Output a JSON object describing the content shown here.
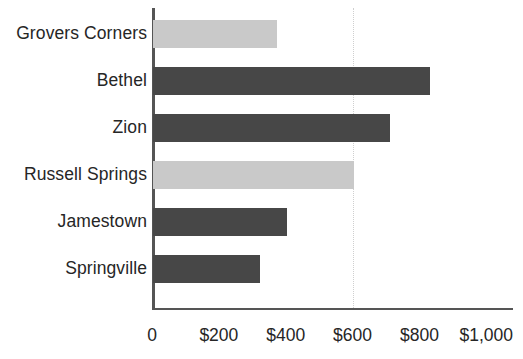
{
  "chart_data": {
    "type": "bar",
    "orientation": "horizontal",
    "title": "",
    "subtitle": "",
    "xlabel": "",
    "ylabel": "",
    "categories": [
      "Grovers Corners",
      "Bethel",
      "Zion",
      "Russell Springs",
      "Jamestown",
      "Springville"
    ],
    "values": [
      370,
      830,
      710,
      600,
      400,
      320
    ],
    "bar_colors": [
      "#c9c9c9",
      "#474747",
      "#474747",
      "#c9c9c9",
      "#474747",
      "#474747"
    ],
    "xlim": [
      0,
      1080
    ],
    "ylim": [
      0,
      6
    ],
    "x_ticks": [
      0,
      200,
      400,
      600,
      800,
      1000
    ],
    "x_tick_labels": [
      "0",
      "$200",
      "$400",
      "$600",
      "$800",
      "$1,000"
    ],
    "gridlines": [
      600
    ],
    "grid": "single-dotted-vertical",
    "legend": "none",
    "axis_color": "#555555",
    "gridline_color": "#cfcfcf",
    "background": "#ffffff"
  },
  "bars": [
    {
      "label": "Grovers Corners",
      "value": 370,
      "color": "#c9c9c9"
    },
    {
      "label": "Bethel",
      "value": 830,
      "color": "#474747"
    },
    {
      "label": "Zion",
      "value": 710,
      "color": "#474747"
    },
    {
      "label": "Russell Springs",
      "value": 600,
      "color": "#c9c9c9"
    },
    {
      "label": "Jamestown",
      "value": 400,
      "color": "#474747"
    },
    {
      "label": "Springville",
      "value": 320,
      "color": "#474747"
    }
  ],
  "x_axis": {
    "ticks": [
      {
        "value": 0,
        "label": "0"
      },
      {
        "value": 200,
        "label": "$200"
      },
      {
        "value": 400,
        "label": "$400"
      },
      {
        "value": 600,
        "label": "$600"
      },
      {
        "value": 800,
        "label": "$800"
      },
      {
        "value": 1000,
        "label": "$1,000"
      }
    ]
  }
}
